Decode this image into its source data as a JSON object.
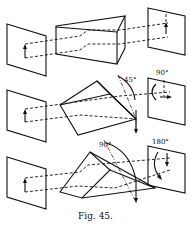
{
  "figure": {
    "caption": "Fig. 45.",
    "panels": [
      {
        "name": "plain-prism",
        "labels": []
      },
      {
        "name": "prism-rotated-45",
        "labels": [
          "45°",
          "90°"
        ]
      },
      {
        "name": "prism-rotated-90",
        "labels": [
          "90°",
          "180°"
        ]
      }
    ],
    "labels": {
      "p2_angle_prism": "45°",
      "p2_angle_image": "90°",
      "p3_angle_prism": "90°",
      "p3_angle_image": "180°"
    }
  }
}
